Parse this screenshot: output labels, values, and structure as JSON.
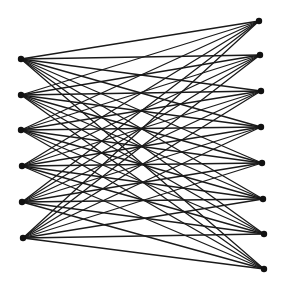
{
  "diagram": {
    "type": "complete-bipartite-graph",
    "name": "K6,8",
    "left_partition": {
      "count": 6,
      "nodes": [
        {
          "x": 21,
          "y": 59
        },
        {
          "x": 21,
          "y": 95
        },
        {
          "x": 21,
          "y": 130
        },
        {
          "x": 22,
          "y": 166
        },
        {
          "x": 22,
          "y": 202
        },
        {
          "x": 23,
          "y": 238
        }
      ]
    },
    "right_partition": {
      "count": 8,
      "nodes": [
        {
          "x": 259,
          "y": 21
        },
        {
          "x": 260,
          "y": 55
        },
        {
          "x": 261,
          "y": 91
        },
        {
          "x": 261,
          "y": 127
        },
        {
          "x": 262,
          "y": 163
        },
        {
          "x": 263,
          "y": 199
        },
        {
          "x": 264,
          "y": 234
        },
        {
          "x": 264,
          "y": 269
        }
      ]
    },
    "edges": "all left-right pairs (48)",
    "node_radius": 3.2,
    "colors": {
      "edge": "#1a1a1a",
      "node": "#111111",
      "background": "#ffffff"
    }
  }
}
